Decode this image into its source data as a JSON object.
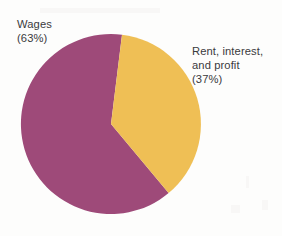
{
  "figure": {
    "background_color": "#fdfdfc",
    "text_color": "#3a3a3c"
  },
  "chart_data": {
    "type": "pie",
    "title": "",
    "subtitle": "",
    "xlabel": "",
    "ylabel": "",
    "legend_position": "none",
    "grid": false,
    "units": "percent",
    "total": 100,
    "start_angle_deg": 7,
    "direction": "clockwise",
    "categories": [
      "Wages",
      "Rent, interest, and profit"
    ],
    "values": [
      63,
      37
    ],
    "colors": [
      "#9e4a79",
      "#efbf55"
    ],
    "slices": [
      {
        "name": "Wages",
        "value": 63,
        "percent_text": "(63%)",
        "color": "#9e4a79",
        "label_lines": [
          "Wages",
          "(63%)"
        ],
        "label_position": "outside-top-left"
      },
      {
        "name": "Rent, interest, and profit",
        "value": 37,
        "percent_text": "(37%)",
        "color": "#efbf55",
        "label_lines": [
          "Rent, interest,",
          "and profit",
          "(37%)"
        ],
        "label_position": "outside-right"
      }
    ],
    "geometry": {
      "center_x": 111,
      "center_y": 124,
      "radius": 90
    }
  },
  "labels": {
    "wages": {
      "line1": "Wages",
      "line2": "(63%)"
    },
    "rent": {
      "line1": "Rent, interest,",
      "line2": "and profit",
      "line3": "(37%)"
    }
  }
}
